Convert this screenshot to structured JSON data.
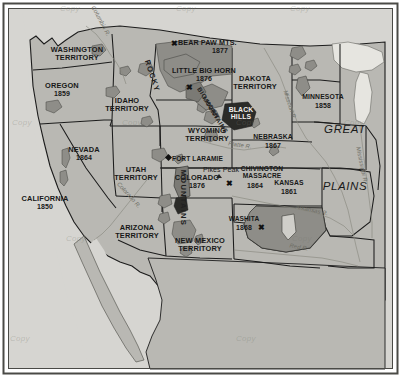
{
  "map": {
    "title": "Western United States Territories and Indian Wars",
    "colors": {
      "land": "#b9b8b3",
      "land_light": "#c6c5c0",
      "reservation": "#8e8d88",
      "reservation_dark": "#7b7a75",
      "water": "#e6e5e0",
      "ocean": "#d6d5d1",
      "border": "#1c1c1c",
      "frame": "#4a4a46",
      "text": "#181818",
      "river": "#8a8a80"
    },
    "frame": {
      "visible": true
    },
    "states": [
      {
        "name": "WASHINGTON\nTERRITORY",
        "year": "",
        "x": 77,
        "y": 53
      },
      {
        "name": "OREGON",
        "year": "1859",
        "x": 62,
        "y": 88
      },
      {
        "name": "IDAHO\nTERRITORY",
        "year": "",
        "x": 127,
        "y": 103
      },
      {
        "name": "NEVADA",
        "year": "1864",
        "x": 84,
        "y": 152
      },
      {
        "name": "CALIFORNIA",
        "year": "1850",
        "x": 44,
        "y": 201
      },
      {
        "name": "UTAH\nTERRITORY",
        "year": "",
        "x": 135,
        "y": 172
      },
      {
        "name": "ARIZONA\nTERRITORY",
        "year": "",
        "x": 136,
        "y": 230
      },
      {
        "name": "NEW MEXICO\nTERRITORY",
        "year": "",
        "x": 199,
        "y": 243
      },
      {
        "name": "WYOMING\nTERRITORY",
        "year": "",
        "x": 206,
        "y": 133
      },
      {
        "name": "COLORADO",
        "year": "1876",
        "x": 196,
        "y": 180
      },
      {
        "name": "DAKOTA\nTERRITORY",
        "year": "",
        "x": 254,
        "y": 81
      },
      {
        "name": "MINNESOTA",
        "year": "1858",
        "x": 322,
        "y": 100
      },
      {
        "name": "NEBRASKA",
        "year": "1867",
        "x": 272,
        "y": 140
      },
      {
        "name": "KANSAS",
        "year": "1861",
        "x": 288,
        "y": 186
      }
    ],
    "events": [
      {
        "label": "BEAR PAW MTS.",
        "year": "1877",
        "x": 219,
        "y": 45,
        "marker_x": 173,
        "marker_y": 42
      },
      {
        "label": "LITTLE BIG HORN",
        "year": "1876",
        "x": 204,
        "y": 73,
        "marker_x": 188,
        "marker_y": 89
      },
      {
        "label": "CHIVINGTON\nMASSACRE",
        "year": "1864",
        "x": 258,
        "y": 175,
        "marker_x": 238,
        "marker_y": 189
      },
      {
        "label": "WASHITA",
        "year": "1868",
        "x": 242,
        "y": 222,
        "marker_x": 260,
        "marker_y": 229
      }
    ],
    "places": [
      {
        "label": "FORT LARAMIE",
        "x": 199,
        "y": 162,
        "type": "fort"
      },
      {
        "label": "Pikes Peak",
        "x": 220,
        "y": 173,
        "type": "peak"
      },
      {
        "label": "BLACK\nHILLS",
        "x": 241,
        "y": 113,
        "type": "hills"
      }
    ],
    "regions": [
      {
        "label": "GREAT",
        "x": 345,
        "y": 131
      },
      {
        "label": "PLAINS",
        "x": 345,
        "y": 188
      }
    ],
    "ranges": [
      {
        "label": "ROCKY",
        "x": 152,
        "y": 78,
        "rotate": 72
      },
      {
        "label": "MOUNTAINS",
        "x": 182,
        "y": 200,
        "rotate": 90
      },
      {
        "label": "BIG HORN",
        "x": 207,
        "y": 104,
        "rotate": 58
      },
      {
        "label": "MOUNTAINS",
        "x": 213,
        "y": 116,
        "rotate": 58
      }
    ],
    "rivers": [
      {
        "label": "Columbia R.",
        "x": 100,
        "y": 23,
        "rotate": 62
      },
      {
        "label": "Missouri R.",
        "x": 289,
        "y": 107,
        "rotate": 72
      },
      {
        "label": "Platte R.",
        "x": 240,
        "y": 146,
        "rotate": 8
      },
      {
        "label": "Colorado R.",
        "x": 128,
        "y": 196,
        "rotate": 48
      },
      {
        "label": "Mississippi R.",
        "x": 360,
        "y": 168,
        "rotate": 78
      },
      {
        "label": "Arkansas R.",
        "x": 310,
        "y": 211,
        "rotate": 12
      },
      {
        "label": "Red R.",
        "x": 298,
        "y": 248,
        "rotate": 10
      }
    ],
    "watermarks": [
      {
        "text": "Copy",
        "x": 74,
        "y": 8
      },
      {
        "text": "Copy",
        "x": 188,
        "y": 8
      },
      {
        "text": "Copy",
        "x": 300,
        "y": 8
      },
      {
        "text": "Copy",
        "x": 16,
        "y": 124
      },
      {
        "text": "Copy",
        "x": 130,
        "y": 124
      },
      {
        "text": "Copy",
        "x": 244,
        "y": 124
      },
      {
        "text": "Copy",
        "x": 352,
        "y": 124
      },
      {
        "text": "Copy",
        "x": 74,
        "y": 240
      },
      {
        "text": "Copy",
        "x": 188,
        "y": 240
      },
      {
        "text": "Copy",
        "x": 300,
        "y": 240
      },
      {
        "text": "Copy",
        "x": 16,
        "y": 340
      },
      {
        "text": "Copy",
        "x": 244,
        "y": 340
      }
    ]
  }
}
